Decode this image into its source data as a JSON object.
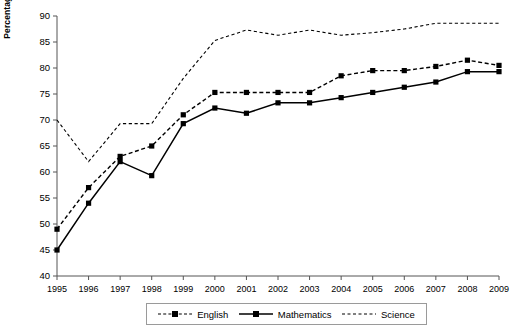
{
  "chart_data": {
    "type": "line",
    "title": "",
    "subtitle": "",
    "xlabel": "",
    "ylabel": "Percentage achieving expected level 4 or above",
    "ylabel_line1": "Percentage achieving expected level",
    "ylabel_line2": "4 or above",
    "categories": [
      "1995",
      "1996",
      "1997",
      "1998",
      "1999",
      "2000",
      "2001",
      "2002",
      "2003",
      "2004",
      "2005",
      "2006",
      "2007",
      "2008",
      "2009"
    ],
    "x": [
      1995,
      1996,
      1997,
      1998,
      1999,
      2000,
      2001,
      2002,
      2003,
      2004,
      2005,
      2006,
      2007,
      2008,
      2009
    ],
    "xlim": [
      1995,
      2009
    ],
    "ylim": [
      40,
      90
    ],
    "yticks": [
      40,
      45,
      50,
      55,
      60,
      65,
      70,
      75,
      80,
      85,
      90
    ],
    "ytick_labels": [
      "40",
      "45",
      "50",
      "55",
      "60",
      "65",
      "70",
      "75",
      "80",
      "85",
      "90"
    ],
    "grid": false,
    "legend_position": "bottom",
    "series": [
      {
        "name": "English",
        "style": "dashed",
        "marker": "square",
        "color": "#000000",
        "values": [
          49,
          57,
          63,
          65,
          71,
          75.3,
          75.3,
          75.3,
          75.3,
          78.5,
          79.5,
          79.5,
          80.3,
          81.5,
          80.5
        ]
      },
      {
        "name": "Mathematics",
        "style": "solid",
        "marker": "square",
        "color": "#000000",
        "values": [
          45,
          54,
          62,
          59.3,
          69.3,
          72.3,
          71.3,
          73.3,
          73.3,
          74.3,
          75.3,
          76.3,
          77.3,
          79.3,
          79.3
        ]
      },
      {
        "name": "Science",
        "style": "dotted",
        "marker": "none",
        "color": "#000000",
        "values": [
          70,
          62,
          69.3,
          69.3,
          78,
          85.3,
          87.3,
          86.3,
          87.3,
          86.3,
          86.8,
          87.5,
          88.6,
          88.6,
          88.6
        ]
      }
    ]
  },
  "legend": {
    "items": [
      {
        "label": "English",
        "style": "dashed-square"
      },
      {
        "label": "Mathematics",
        "style": "solid-square"
      },
      {
        "label": "Science",
        "style": "dotted-plain"
      }
    ]
  },
  "axes": {
    "y_title_line1": "Percentage achieving expected level",
    "y_title_line2": "4 or above"
  }
}
